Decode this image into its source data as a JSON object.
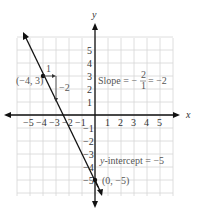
{
  "chart_data": {
    "type": "line",
    "title": "",
    "xlabel": "x",
    "ylabel": "y",
    "xlim": [
      -6,
      6
    ],
    "ylim": [
      -6,
      6
    ],
    "grid": true,
    "x_ticks": [
      "-5",
      "-4",
      "-3",
      "-2",
      "-1",
      "1",
      "2",
      "3",
      "4",
      "5"
    ],
    "y_ticks": [
      "5",
      "4",
      "3",
      "2",
      "1",
      "-1",
      "-2",
      "-3",
      "-4",
      "-5"
    ],
    "series": [
      {
        "name": "y = -2x - 5",
        "equation": "y = -2x - 5",
        "slope": -2,
        "intercept": -5
      }
    ],
    "points": [
      {
        "label": "(-4, 3)",
        "x": -4,
        "y": 3
      },
      {
        "label": "(0, -5)",
        "x": 0,
        "y": -5
      }
    ],
    "annotations": {
      "run_label": "1",
      "rise_label": "-2",
      "slope_text": "Slope = -2/1 = -2",
      "slope_prefix": "Slope = −",
      "slope_num": "2",
      "slope_den": "1",
      "slope_suffix": "= −2",
      "intercept_text": "y-intercept = −5",
      "intercept_y": "y",
      "intercept_rest": "-intercept = −5"
    }
  },
  "labels": {
    "x_axis": "x",
    "y_axis": "y",
    "point_a": "(−4, 3)",
    "point_b": "(0, −5)",
    "run": "1",
    "rise": "−2"
  }
}
